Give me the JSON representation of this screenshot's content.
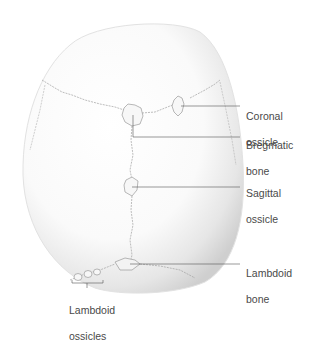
{
  "diagram": {
    "labels": [
      {
        "id": "coronal-ossicle",
        "line1": "Coronal",
        "line2": "ossicle"
      },
      {
        "id": "bregmatic-bone",
        "line1": "Bregmatic",
        "line2": "bone"
      },
      {
        "id": "sagittal-ossicle",
        "line1": "Sagittal",
        "line2": "ossicle"
      },
      {
        "id": "lambdoid-bone",
        "line1": "Lambdoid",
        "line2": "bone"
      },
      {
        "id": "lambdoid-ossicles",
        "line1": "Lambdoid",
        "line2": "ossicles"
      }
    ],
    "colors": {
      "background": "#ffffff",
      "bone": "#f7f7f7",
      "shadow": "#c8c8c8",
      "suture": "#9a9a9a",
      "leader": "#555555",
      "text": "#4a4a4a"
    }
  }
}
